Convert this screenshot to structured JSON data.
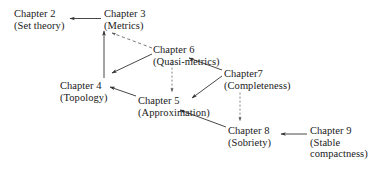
{
  "diagram": {
    "type": "dependency-graph",
    "colors": {
      "background": "#ffffff",
      "text": "#1a1a1a",
      "edge": "#333333"
    },
    "nodes": [
      {
        "id": "ch2",
        "chapter": "Chapter 2",
        "topic": "(Set theory)",
        "x": 14,
        "y": 8
      },
      {
        "id": "ch3",
        "chapter": "Chapter 3",
        "topic": "(Metrics)",
        "x": 104,
        "y": 8
      },
      {
        "id": "ch6",
        "chapter": "Chapter 6",
        "topic": "(Quasi-metrics)",
        "x": 153,
        "y": 44
      },
      {
        "id": "ch4",
        "chapter": "Chapter 4",
        "topic": "(Topology)",
        "x": 60,
        "y": 80
      },
      {
        "id": "ch7",
        "chapter": "Chapter7",
        "topic": "(Completeness)",
        "x": 224,
        "y": 68
      },
      {
        "id": "ch5",
        "chapter": "Chapter 5",
        "topic": "(Approximation)",
        "x": 138,
        "y": 95
      },
      {
        "id": "ch8",
        "chapter": "Chapter 8",
        "topic": "(Sobriety)",
        "x": 228,
        "y": 125
      },
      {
        "id": "ch9",
        "chapter": "Chapter 9",
        "topic_line1": "(Stable",
        "topic_line2": "compactness)",
        "x": 310,
        "y": 125
      }
    ],
    "edges": [
      {
        "from": "ch3",
        "to": "ch2",
        "style": "solid",
        "label": "metrics-to-set-theory"
      },
      {
        "from": "ch4",
        "to": "ch3",
        "style": "solid",
        "label": "topology-to-metrics"
      },
      {
        "from": "ch6",
        "to": "ch3",
        "style": "dashed",
        "label": "quasi-metrics-to-metrics"
      },
      {
        "from": "ch6",
        "to": "ch4",
        "style": "solid",
        "label": "quasi-metrics-to-topology"
      },
      {
        "from": "ch6",
        "to": "ch5",
        "style": "dotted",
        "label": "quasi-metrics-to-approximation"
      },
      {
        "from": "ch5",
        "to": "ch4",
        "style": "solid",
        "label": "approximation-to-topology"
      },
      {
        "from": "ch7",
        "to": "ch6",
        "style": "solid",
        "label": "completeness-to-quasi-metrics"
      },
      {
        "from": "ch7",
        "to": "ch5",
        "style": "solid",
        "label": "completeness-to-approximation"
      },
      {
        "from": "ch7",
        "to": "ch8",
        "style": "dotted",
        "label": "completeness-to-sobriety"
      },
      {
        "from": "ch8",
        "to": "ch5",
        "style": "solid",
        "label": "sobriety-to-approximation"
      },
      {
        "from": "ch9",
        "to": "ch8",
        "style": "solid",
        "label": "stable-compactness-to-sobriety"
      }
    ]
  }
}
